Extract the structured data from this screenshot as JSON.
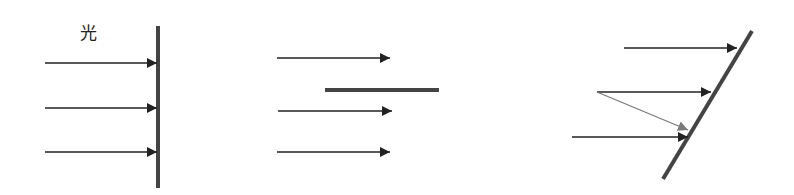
{
  "label": {
    "text": "光",
    "x": 80,
    "y": 20
  },
  "colors": {
    "line": "#222222",
    "bar": "#444444",
    "reflected": "#7a7a7a",
    "background": "#ffffff"
  },
  "panels": [
    {
      "name": "perpendicular-surface",
      "surface": {
        "x1": 158,
        "y1": 26,
        "x2": 158,
        "y2": 188,
        "width": 4
      },
      "arrows": [
        {
          "x1": 45,
          "y1": 63,
          "x2": 157,
          "y2": 63
        },
        {
          "x1": 45,
          "y1": 108,
          "x2": 157,
          "y2": 108
        },
        {
          "x1": 45,
          "y1": 152,
          "x2": 157,
          "y2": 152
        }
      ]
    },
    {
      "name": "parallel-surface",
      "surface": {
        "x1": 325,
        "y1": 90,
        "x2": 439,
        "y2": 90,
        "width": 4
      },
      "arrows": [
        {
          "x1": 277,
          "y1": 58,
          "x2": 390,
          "y2": 58
        },
        {
          "x1": 278,
          "y1": 111,
          "x2": 392,
          "y2": 111
        },
        {
          "x1": 277,
          "y1": 152,
          "x2": 390,
          "y2": 152
        }
      ]
    },
    {
      "name": "inclined-surface",
      "surface": {
        "x1": 752,
        "y1": 31,
        "x2": 663,
        "y2": 179,
        "width": 4
      },
      "arrows": [
        {
          "x1": 624,
          "y1": 48,
          "x2": 737,
          "y2": 48
        },
        {
          "x1": 597,
          "y1": 92,
          "x2": 711,
          "y2": 92
        },
        {
          "x1": 572,
          "y1": 137,
          "x2": 688,
          "y2": 137
        }
      ],
      "reflected": [
        {
          "x1": 597,
          "y1": 92,
          "x2": 688,
          "y2": 130
        }
      ]
    }
  ]
}
